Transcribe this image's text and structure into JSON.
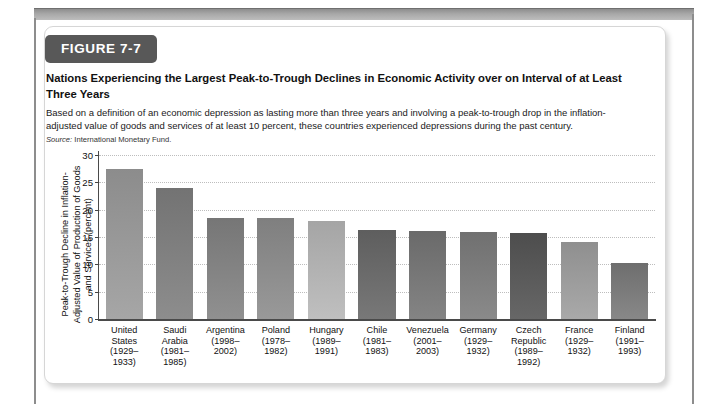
{
  "figure": {
    "badge": "FIGURE 7-7",
    "title": "Nations Experiencing the Largest Peak-to-Trough Declines in Economic Activity over on Interval of at Least Three Years",
    "subtitle": "Based on a definition of an economic depression as lasting more than three years and involving a peak-to-trough drop in the inflation-adjusted value of goods and services of at least 10 percent, these countries experienced depressions during the past century.",
    "source_label": "Source:",
    "source_value": "International Monetary Fund."
  },
  "chart_data": {
    "type": "bar",
    "title": "Nations Experiencing the Largest Peak-to-Trough Declines in Economic Activity over on Interval of at Least Three Years",
    "xlabel": "",
    "ylabel": "Peak-to-Trough Decline in Inflation-Adjusted Value of Production of Goods and Services (percent)",
    "ylim": [
      0,
      30
    ],
    "yticks": [
      0,
      5,
      10,
      15,
      20,
      25,
      30
    ],
    "ytick_labels": [
      "0",
      "5",
      "10",
      "15",
      "20",
      "25",
      "30"
    ],
    "grid": true,
    "legend": "none",
    "categories": [
      "United States (1929–1933)",
      "Saudi Arabia (1981–1985)",
      "Argentina (1998–2002)",
      "Poland (1978–1982)",
      "Hungary (1989–1991)",
      "Chile (1981–1983)",
      "Venezuela (2001–2003)",
      "Germany (1929–1932)",
      "Czech Republic (1989–1992)",
      "France (1929–1932)",
      "Finland (1991–1993)"
    ],
    "category_lines": [
      [
        "United",
        "States",
        "(1929–",
        "1933)"
      ],
      [
        "Saudi",
        "Arabia",
        "(1981–",
        "1985)"
      ],
      [
        "Argentina",
        "(1998–",
        "2002)"
      ],
      [
        "Poland",
        "(1978–",
        "1982)"
      ],
      [
        "Hungary",
        "(1989–",
        "1991)"
      ],
      [
        "Chile",
        "(1981–",
        "1983)"
      ],
      [
        "Venezuela",
        "(2001–",
        "2003)"
      ],
      [
        "Germany",
        "(1929–",
        "1932)"
      ],
      [
        "Czech",
        "Republic",
        "(1989–",
        "1992)"
      ],
      [
        "France",
        "(1929–",
        "1932)"
      ],
      [
        "Finland",
        "(1991–",
        "1993)"
      ]
    ],
    "values": [
      27.5,
      24.0,
      18.5,
      18.4,
      18.0,
      16.3,
      16.1,
      16.0,
      15.8,
      14.1,
      10.3
    ],
    "bar_colors": [
      "#8c8c8c",
      "#737373",
      "#767676",
      "#7f7f7f",
      "#a5a5a5",
      "#5e5e5e",
      "#6a6a6a",
      "#707070",
      "#4d4d4d",
      "#8f8f8f",
      "#6e6e6e"
    ]
  }
}
